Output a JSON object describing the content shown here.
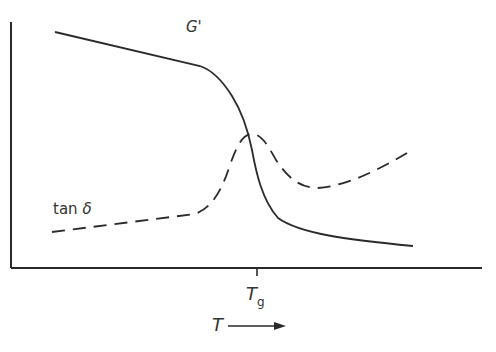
{
  "diagram": {
    "title": "",
    "curves": [
      {
        "name": "G'",
        "label": "G'",
        "style": "solid"
      },
      {
        "name": "tan δ",
        "label_prefix": "tan",
        "label_symbol": "δ",
        "style": "dashed"
      }
    ],
    "x_axis": {
      "label": "T",
      "arrow": "→",
      "tick_label_main": "T",
      "tick_label_sub": "g"
    },
    "y_axis": {
      "label": ""
    }
  },
  "colors": {
    "line": "#2a2a2a",
    "background": "#ffffff"
  }
}
